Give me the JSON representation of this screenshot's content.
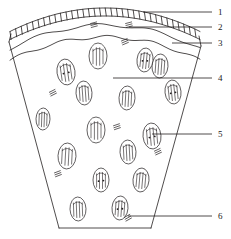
{
  "figure": {
    "name": "plant-stem-cross-section-diagram",
    "type": "botanical-line-drawing",
    "background_color": "#ffffff",
    "stroke_color": "#231f20",
    "width": 231,
    "height": 239
  },
  "labels": [
    {
      "id": "label-1",
      "text": "1",
      "x": 218,
      "y": 8,
      "leader": {
        "x1": 143,
        "y1": 12,
        "x2": 212,
        "y2": 12
      }
    },
    {
      "id": "label-2",
      "text": "2",
      "x": 218,
      "y": 23,
      "leader": {
        "x1": 129,
        "y1": 27,
        "x2": 212,
        "y2": 27
      }
    },
    {
      "id": "label-3",
      "text": "3",
      "x": 218,
      "y": 39,
      "leader": {
        "x1": 172,
        "y1": 43,
        "x2": 212,
        "y2": 43
      }
    },
    {
      "id": "label-4",
      "text": "4",
      "x": 218,
      "y": 74,
      "leader": {
        "x1": 113,
        "y1": 78,
        "x2": 212,
        "y2": 78
      }
    },
    {
      "id": "label-5",
      "text": "5",
      "x": 218,
      "y": 130,
      "leader": {
        "x1": 152,
        "y1": 134,
        "x2": 212,
        "y2": 134
      }
    },
    {
      "id": "label-6",
      "text": "6",
      "x": 218,
      "y": 212,
      "leader": {
        "x1": 128,
        "y1": 216,
        "x2": 212,
        "y2": 216
      }
    }
  ],
  "outline": {
    "name": "stem-wedge-outline",
    "left_edge": "M 9,42 L 59,228",
    "right_edge": "M 201,46 L 151,228",
    "bottom_edge": "M 59,228 L 151,228"
  },
  "layers": [
    {
      "name": "epidermis-cell-band",
      "note": "arched row of rectangular cells along the top"
    },
    {
      "name": "hypodermis-wavy-line",
      "note": "wavy boundary below epidermis"
    },
    {
      "name": "inner-wavy-line",
      "note": "second wavy boundary enclosing ground tissue"
    }
  ],
  "bundles": [
    {
      "x": 66,
      "y": 72,
      "rx": 9,
      "ry": 13,
      "rot": -8
    },
    {
      "x": 160,
      "y": 66,
      "rx": 8,
      "ry": 12,
      "rot": 4
    },
    {
      "x": 98,
      "y": 56,
      "rx": 9,
      "ry": 13,
      "rot": 0
    },
    {
      "x": 145,
      "y": 60,
      "rx": 8,
      "ry": 12,
      "rot": 6
    },
    {
      "x": 84,
      "y": 93,
      "rx": 8,
      "ry": 12,
      "rot": -4
    },
    {
      "x": 127,
      "y": 98,
      "rx": 8,
      "ry": 12,
      "rot": 3
    },
    {
      "x": 173,
      "y": 92,
      "rx": 8,
      "ry": 12,
      "rot": -6
    },
    {
      "x": 43,
      "y": 119,
      "rx": 7,
      "ry": 11,
      "rot": 2
    },
    {
      "x": 96,
      "y": 130,
      "rx": 9,
      "ry": 13,
      "rot": 0
    },
    {
      "x": 152,
      "y": 136,
      "rx": 9,
      "ry": 13,
      "rot": -5
    },
    {
      "x": 67,
      "y": 156,
      "rx": 9,
      "ry": 13,
      "rot": 3
    },
    {
      "x": 128,
      "y": 152,
      "rx": 8,
      "ry": 12,
      "rot": -3
    },
    {
      "x": 101,
      "y": 180,
      "rx": 8,
      "ry": 12,
      "rot": 0
    },
    {
      "x": 141,
      "y": 180,
      "rx": 8,
      "ry": 12,
      "rot": 5
    },
    {
      "x": 78,
      "y": 209,
      "rx": 8,
      "ry": 12,
      "rot": -2
    },
    {
      "x": 120,
      "y": 208,
      "rx": 8,
      "ry": 12,
      "rot": 4
    }
  ],
  "fiber_groups": [
    {
      "x": 53,
      "y": 93,
      "rot": -22
    },
    {
      "x": 125,
      "y": 42,
      "rot": -18
    },
    {
      "x": 117,
      "y": 127,
      "rot": -14
    },
    {
      "x": 158,
      "y": 152,
      "rot": -20
    },
    {
      "x": 58,
      "y": 174,
      "rot": -16
    },
    {
      "x": 128,
      "y": 218,
      "rot": -24
    },
    {
      "x": 94,
      "y": 25,
      "rot": -10
    },
    {
      "x": 129,
      "y": 25,
      "rot": -10
    }
  ]
}
